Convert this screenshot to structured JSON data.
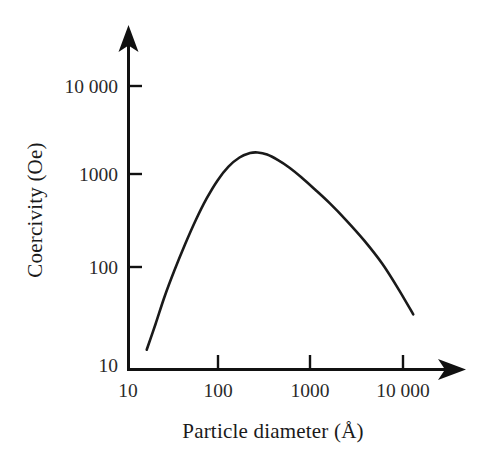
{
  "chart_data": {
    "type": "line",
    "title": "",
    "subtitle": "",
    "xlabel": "Particle diameter (Å)",
    "ylabel": "Coercivity (Oe)",
    "xscale": "log",
    "yscale": "log",
    "xlim": [
      10,
      10000
    ],
    "ylim": [
      10,
      10000
    ],
    "xticks": [
      10,
      100,
      1000,
      10000
    ],
    "xtick_labels": [
      "10",
      "100",
      "1000",
      "10 000"
    ],
    "yticks": [
      10,
      100,
      1000,
      10000
    ],
    "ytick_labels": [
      "10",
      "100",
      "1000",
      "10 000"
    ],
    "grid": false,
    "legend": null,
    "annotations": [],
    "line_color": "#1a1a1a",
    "line_width_px": 2.6,
    "series": [
      {
        "name": "Coercivity vs particle diameter",
        "x": [
          16,
          20,
          25,
          32,
          42,
          55,
          72,
          95,
          125,
          165,
          215,
          260,
          330,
          430,
          570,
          780,
          1100,
          1600,
          2400,
          3800,
          6000,
          9000,
          13000
        ],
        "y": [
          16,
          30,
          58,
          110,
          210,
          380,
          640,
          1000,
          1400,
          1750,
          1950,
          1980,
          1880,
          1650,
          1380,
          1080,
          800,
          570,
          380,
          230,
          130,
          70,
          38
        ]
      }
    ]
  },
  "axes": {
    "x_axis_name": "x-axis-log-particle-diameter",
    "y_axis_name": "y-axis-log-coercivity",
    "arrow_x": "arrow-head-x",
    "arrow_y": "arrow-head-y"
  }
}
